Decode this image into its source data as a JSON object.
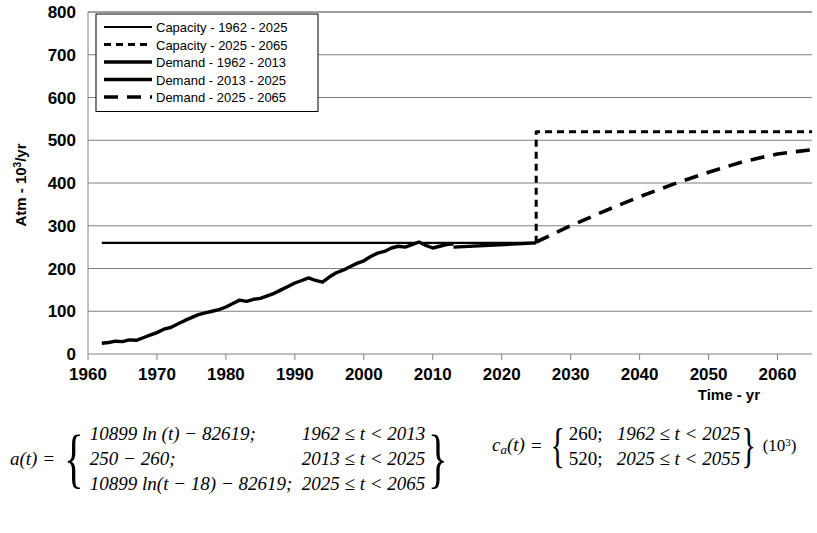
{
  "chart_data": {
    "type": "line",
    "title": "",
    "xlabel": "Time - yr",
    "ylabel": "Atm - 10³/yr",
    "xlim": [
      1960,
      2065
    ],
    "ylim": [
      0,
      800
    ],
    "xticks": [
      1960,
      1970,
      1980,
      1990,
      2000,
      2010,
      2020,
      2030,
      2040,
      2050,
      2060
    ],
    "yticks": [
      0,
      100,
      200,
      300,
      400,
      500,
      600,
      700,
      800
    ],
    "grid": true,
    "legend_position": "top-left",
    "series": [
      {
        "name": "Capacity - 1962 - 2025",
        "style": "solid-thin",
        "x": [
          1962,
          2025
        ],
        "values": [
          260,
          260
        ]
      },
      {
        "name": "Capacity - 2025 - 2065",
        "style": "dashed-short",
        "x": [
          2025,
          2025,
          2065
        ],
        "values": [
          260,
          520,
          520
        ]
      },
      {
        "name": "Demand - 1962 - 2013",
        "style": "solid-thick",
        "x": [
          1962,
          1963,
          1964,
          1965,
          1966,
          1967,
          1968,
          1969,
          1970,
          1971,
          1972,
          1973,
          1974,
          1975,
          1976,
          1977,
          1978,
          1979,
          1980,
          1981,
          1982,
          1983,
          1984,
          1985,
          1986,
          1987,
          1988,
          1989,
          1990,
          1991,
          1992,
          1993,
          1994,
          1995,
          1996,
          1997,
          1998,
          1999,
          2000,
          2001,
          2002,
          2003,
          2004,
          2005,
          2006,
          2007,
          2008,
          2009,
          2010,
          2011,
          2012,
          2013
        ],
        "values": [
          25,
          27,
          30,
          29,
          33,
          32,
          38,
          44,
          50,
          58,
          62,
          70,
          78,
          85,
          92,
          96,
          100,
          104,
          110,
          118,
          126,
          123,
          128,
          130,
          136,
          142,
          150,
          158,
          166,
          172,
          178,
          172,
          168,
          180,
          190,
          196,
          204,
          212,
          218,
          228,
          236,
          240,
          248,
          252,
          250,
          256,
          262,
          254,
          248,
          252,
          256,
          258
        ]
      },
      {
        "name": "Demand - 2013 - 2025",
        "style": "solid-thick",
        "x": [
          2013,
          2025
        ],
        "values": [
          250,
          260
        ]
      },
      {
        "name": "Demand - 2025 - 2065",
        "style": "dashed-long",
        "x": [
          2025,
          2030,
          2035,
          2040,
          2045,
          2050,
          2055,
          2060,
          2065
        ],
        "values": [
          262,
          300,
          335,
          368,
          398,
          425,
          450,
          468,
          478
        ]
      }
    ]
  },
  "equations": {
    "a": {
      "name": "a(t)",
      "equals": "=",
      "cases": [
        {
          "expr": "10899 ln (t) − 82619;",
          "cond": "1962 ≤ t < 2013"
        },
        {
          "expr": "250 − 260;",
          "cond": "2013 ≤ t < 2025"
        },
        {
          "expr": "10899 ln(t − 18) − 82619;",
          "cond": "2025 ≤ t < 2065"
        }
      ]
    },
    "c": {
      "name": "c",
      "sub": "a",
      "arg": "(t)",
      "equals": "=",
      "cases": [
        {
          "expr": "260;",
          "cond": "1962 ≤ t < 2025"
        },
        {
          "expr": "520;",
          "cond": "2025 ≤ t < 2055"
        }
      ],
      "tail_prefix": "(10",
      "tail_sup": "3",
      "tail_suffix": ")"
    }
  },
  "colors": {
    "line": "#000000",
    "grid": "#808080",
    "background": "#ffffff"
  }
}
